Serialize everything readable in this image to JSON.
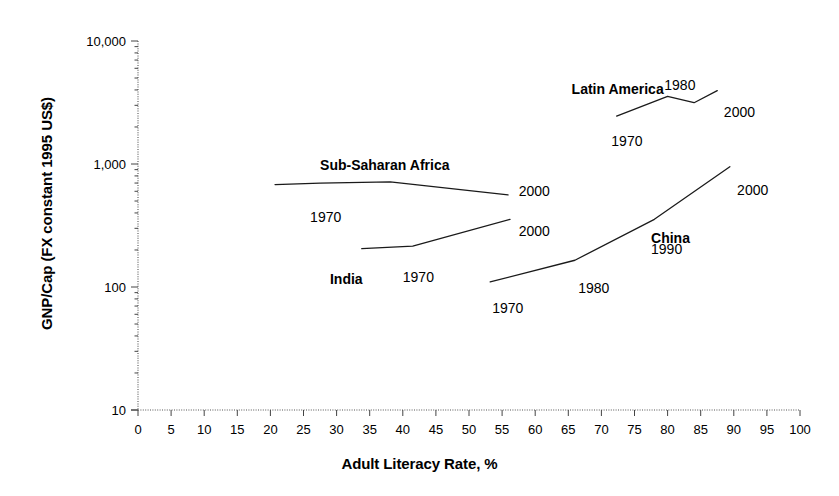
{
  "chart_data": {
    "type": "line",
    "title": "",
    "xlabel": "Adult Literacy Rate, %",
    "ylabel": "GNP/Cap (FX constant 1995 US$)",
    "yscale": "log",
    "ylim": [
      10,
      10000
    ],
    "xlim": [
      0,
      100
    ],
    "grid": false,
    "legend_position": "inline-annotations",
    "xticks": [
      "0",
      "5",
      "10",
      "15",
      "20",
      "25",
      "30",
      "35",
      "40",
      "45",
      "50",
      "55",
      "60",
      "65",
      "70",
      "75",
      "80",
      "85",
      "90",
      "95",
      "100"
    ],
    "xtick_values": [
      0,
      5,
      10,
      15,
      20,
      25,
      30,
      35,
      40,
      45,
      50,
      55,
      60,
      65,
      70,
      75,
      80,
      85,
      90,
      95,
      100
    ],
    "yticks": [
      "10",
      "100",
      "1,000",
      "10,000"
    ],
    "ytick_values": [
      10,
      100,
      1000,
      10000
    ],
    "series": [
      {
        "name": "Sub-Saharan Africa",
        "label_x": 27.5,
        "label_y": 1150,
        "points": [
          {
            "year": "1970",
            "literacy": 20.7,
            "gnp": 680
          },
          {
            "year": "",
            "literacy": 27.5,
            "gnp": 700
          },
          {
            "year": "",
            "literacy": 38.1,
            "gnp": 715
          },
          {
            "year": "2000",
            "literacy": 55.9,
            "gnp": 560
          }
        ],
        "year_labels": [
          {
            "text": "1970",
            "literacy": 26.0,
            "gnp": 430
          },
          {
            "text": "2000",
            "literacy": 57.5,
            "gnp": 700
          }
        ]
      },
      {
        "name": "India",
        "label_x": 29.0,
        "label_y": 135,
        "points": [
          {
            "year": "1970",
            "literacy": 33.8,
            "gnp": 205
          },
          {
            "year": "",
            "literacy": 41.5,
            "gnp": 215
          },
          {
            "year": "2000",
            "literacy": 56.2,
            "gnp": 355
          }
        ],
        "year_labels": [
          {
            "text": "1970",
            "literacy": 40.0,
            "gnp": 140
          },
          {
            "text": "2000",
            "literacy": 57.5,
            "gnp": 330
          }
        ]
      },
      {
        "name": "China",
        "label_x": 77.5,
        "label_y": 290,
        "points": [
          {
            "year": "1970",
            "literacy": 53.2,
            "gnp": 110
          },
          {
            "year": "1980",
            "literacy": 66.0,
            "gnp": 165
          },
          {
            "year": "1990",
            "literacy": 78.0,
            "gnp": 355
          },
          {
            "year": "2000",
            "literacy": 89.4,
            "gnp": 950
          }
        ],
        "year_labels": [
          {
            "text": "1970",
            "literacy": 53.5,
            "gnp": 78
          },
          {
            "text": "1980",
            "literacy": 66.5,
            "gnp": 115
          },
          {
            "text": "1990",
            "literacy": 77.5,
            "gnp": 235
          },
          {
            "text": "2000",
            "literacy": 90.5,
            "gnp": 720
          }
        ]
      },
      {
        "name": "Latin America",
        "label_x": 65.5,
        "label_y": 4700,
        "points": [
          {
            "year": "1970",
            "literacy": 72.3,
            "gnp": 2450
          },
          {
            "year": "1980",
            "literacy": 80.0,
            "gnp": 3550
          },
          {
            "year": "",
            "literacy": 84.0,
            "gnp": 3150
          },
          {
            "year": "2000",
            "literacy": 87.5,
            "gnp": 3950
          }
        ],
        "year_labels": [
          {
            "text": "1970",
            "literacy": 71.5,
            "gnp": 1800
          },
          {
            "text": "1980",
            "literacy": 79.5,
            "gnp": 5100
          },
          {
            "text": "2000",
            "literacy": 88.5,
            "gnp": 3100
          }
        ]
      }
    ]
  }
}
